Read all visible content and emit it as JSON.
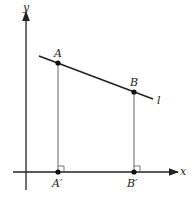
{
  "diagram": {
    "axes": {
      "x_label": "x",
      "y_label": "y"
    },
    "line": {
      "label": "l"
    },
    "points": {
      "A": "A",
      "B": "B",
      "A_prime": "A′",
      "B_prime": "B′"
    },
    "colors": {
      "stroke": "#222222",
      "projection": "#555555",
      "background": "#ffffff"
    }
  }
}
